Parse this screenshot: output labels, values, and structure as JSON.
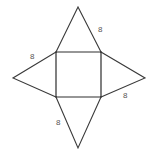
{
  "figure": {
    "type": "geometry-net-diagram",
    "background_color": "#ffffff",
    "line_color": "#3a3a3a",
    "label_color": "#555555",
    "canvas": {
      "width": 153,
      "height": 158
    },
    "square": {
      "name": "central-square",
      "top_left": [
        56,
        52
      ],
      "top_right": [
        101,
        52
      ],
      "bottom_right": [
        101,
        97
      ],
      "bottom_left": [
        56,
        97
      ],
      "side_length_px": 45
    },
    "triangles": [
      {
        "name": "top-triangle",
        "apex": [
          78,
          7
        ],
        "base": [
          [
            56,
            52
          ],
          [
            101,
            52
          ]
        ],
        "label": "8",
        "label_side": "right"
      },
      {
        "name": "left-triangle",
        "apex": [
          13,
          78
        ],
        "base": [
          [
            56,
            52
          ],
          [
            56,
            97
          ]
        ],
        "label": "8",
        "label_side": "upper"
      },
      {
        "name": "right-triangle",
        "apex": [
          145,
          78
        ],
        "base": [
          [
            101,
            52
          ],
          [
            101,
            97
          ]
        ],
        "label": "8",
        "label_side": "lower"
      },
      {
        "name": "bottom-triangle",
        "apex": [
          78,
          148
        ],
        "base": [
          [
            56,
            97
          ],
          [
            101,
            97
          ]
        ],
        "label": "8",
        "label_side": "left"
      }
    ],
    "labels": {
      "top_right": "8",
      "left": "8",
      "right": "8",
      "bottom": "8"
    }
  }
}
